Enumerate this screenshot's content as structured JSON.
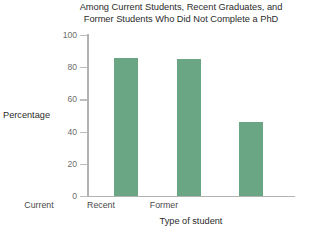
{
  "chart_data": {
    "type": "bar",
    "title": "Among Current Students, Recent Graduates, and Former Students Who Did Not Complete a PhD",
    "title_lines": [
      "Among Current Students, Recent Graduates, and",
      "Former Students Who Did Not Complete a PhD"
    ],
    "categories": [
      "Current",
      "Recent",
      "Former"
    ],
    "values": [
      86,
      85,
      46
    ],
    "xlabel": "Type of student",
    "ylabel": "Percentage",
    "ylim": [
      0,
      100
    ],
    "yticks": [
      0,
      20,
      40,
      60,
      80,
      100
    ],
    "ytick_labels": [
      "0",
      "20",
      "40",
      "60",
      "80",
      "100"
    ],
    "grid": false,
    "legend": null,
    "bar_color": "#6aa584",
    "axis_color": "#b3b3b3",
    "text_color": "#2b2b2b",
    "tick_text_color": "#6d6d6d"
  }
}
